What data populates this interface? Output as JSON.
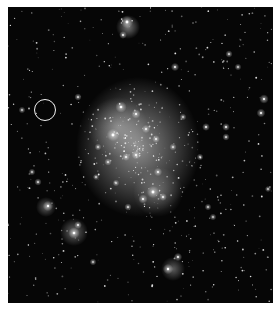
{
  "image": {
    "subject": "star cluster field",
    "background_color": "#060606",
    "frame_color": "#ffffff",
    "marker": {
      "shape": "circle",
      "color": "#f2f2f2",
      "cx": 37,
      "cy": 103,
      "r": 11
    }
  },
  "glows": [
    {
      "cx": 130,
      "cy": 140,
      "rx": 62,
      "ry": 70,
      "o": 0.55
    },
    {
      "cx": 110,
      "cy": 120,
      "rx": 30,
      "ry": 30,
      "o": 0.35
    },
    {
      "cx": 150,
      "cy": 185,
      "rx": 25,
      "ry": 25,
      "o": 0.3
    },
    {
      "cx": 120,
      "cy": 20,
      "rx": 12,
      "ry": 12,
      "o": 0.45
    },
    {
      "cx": 66,
      "cy": 225,
      "rx": 14,
      "ry": 14,
      "o": 0.4
    },
    {
      "cx": 38,
      "cy": 200,
      "rx": 10,
      "ry": 10,
      "o": 0.35
    },
    {
      "cx": 165,
      "cy": 262,
      "rx": 12,
      "ry": 12,
      "o": 0.35
    }
  ],
  "bright_stars": [
    [
      119,
      15,
      2.4
    ],
    [
      115,
      28,
      1.5
    ],
    [
      167,
      60,
      1.6
    ],
    [
      221,
      47,
      1.4
    ],
    [
      256,
      92,
      1.8
    ],
    [
      253,
      106,
      1.7
    ],
    [
      113,
      100,
      2.2
    ],
    [
      128,
      107,
      1.8
    ],
    [
      105,
      128,
      2.4
    ],
    [
      138,
      122,
      1.6
    ],
    [
      148,
      132,
      1.5
    ],
    [
      128,
      148,
      1.7
    ],
    [
      150,
      165,
      1.6
    ],
    [
      118,
      150,
      1.5
    ],
    [
      100,
      155,
      1.4
    ],
    [
      145,
      185,
      2.4
    ],
    [
      135,
      192,
      1.8
    ],
    [
      155,
      190,
      1.5
    ],
    [
      40,
      199,
      2.0
    ],
    [
      66,
      226,
      2.2
    ],
    [
      70,
      218,
      1.5
    ],
    [
      160,
      262,
      2.0
    ],
    [
      170,
      250,
      1.6
    ],
    [
      198,
      120,
      1.5
    ],
    [
      218,
      120,
      1.5
    ],
    [
      218,
      130,
      1.4
    ],
    [
      30,
      175,
      1.4
    ],
    [
      24,
      165,
      1.3
    ],
    [
      70,
      90,
      1.4
    ],
    [
      14,
      103,
      1.3
    ],
    [
      230,
      60,
      1.3
    ],
    [
      260,
      182,
      1.2
    ],
    [
      85,
      255,
      1.3
    ],
    [
      120,
      200,
      1.4
    ],
    [
      200,
      200,
      1.3
    ],
    [
      205,
      210,
      1.3
    ],
    [
      192,
      150,
      1.3
    ],
    [
      175,
      110,
      1.3
    ],
    [
      165,
      140,
      1.4
    ],
    [
      90,
      140,
      1.3
    ],
    [
      88,
      170,
      1.2
    ],
    [
      108,
      176,
      1.3
    ]
  ],
  "star_seed": 7
}
